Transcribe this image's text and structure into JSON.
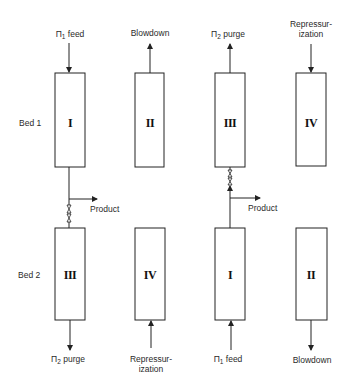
{
  "diagram": {
    "row_labels": [
      "Bed 1",
      "Bed 2"
    ],
    "bed1": {
      "steps": [
        {
          "roman": "I",
          "top_label": "Π",
          "top_sub": "1",
          "top_text": "feed",
          "flow": "in-top"
        },
        {
          "roman": "II",
          "top_label": "Blowdown",
          "flow": "out-top"
        },
        {
          "roman": "III",
          "top_label": "Π",
          "top_sub": "2",
          "top_text": "purge",
          "flow": "out-top"
        },
        {
          "roman": "IV",
          "top_label_line1": "Repressur-",
          "top_label_line2": "ization",
          "flow": "in-top"
        }
      ]
    },
    "bed2": {
      "steps": [
        {
          "roman": "III",
          "bottom_label": "Π",
          "bottom_sub": "2",
          "bottom_text": "purge",
          "flow": "out-bottom"
        },
        {
          "roman": "IV",
          "bottom_label_line1": "Repressur-",
          "bottom_label_line2": "ization",
          "flow": "in-bottom"
        },
        {
          "roman": "I",
          "bottom_label": "Π",
          "bottom_sub": "1",
          "bottom_text": "feed",
          "flow": "in-bottom"
        },
        {
          "roman": "II",
          "bottom_label": "Blowdown",
          "flow": "out-bottom"
        }
      ]
    },
    "product_label": "Product",
    "colors": {
      "line": "#222222",
      "background": "#ffffff"
    }
  }
}
